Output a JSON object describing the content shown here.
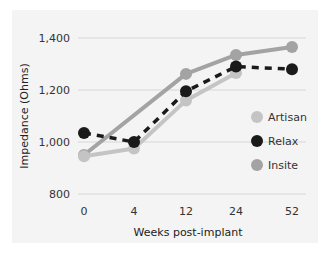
{
  "chart_data": {
    "type": "line",
    "title": "",
    "xlabel": "Weeks post-implant",
    "ylabel": "Impedance (Ohms)",
    "categories": [
      "0",
      "4",
      "12",
      "24",
      "52"
    ],
    "y_ticks": [
      "800",
      "1,000",
      "1,200",
      "1,400"
    ],
    "ylim": [
      800,
      1400
    ],
    "grid": true,
    "legend_position": "right",
    "series": [
      {
        "name": "Artisan",
        "color": "#c4c4c4",
        "style": "solid",
        "values": [
          945,
          975,
          1160,
          1265,
          null
        ]
      },
      {
        "name": "Relax",
        "color": "#1a1a1a",
        "style": "dashed",
        "values": [
          1035,
          1000,
          1195,
          1290,
          1280
        ]
      },
      {
        "name": "Insite",
        "color": "#a3a3a3",
        "style": "solid",
        "values": [
          950,
          null,
          1262,
          1335,
          1365
        ]
      }
    ]
  }
}
